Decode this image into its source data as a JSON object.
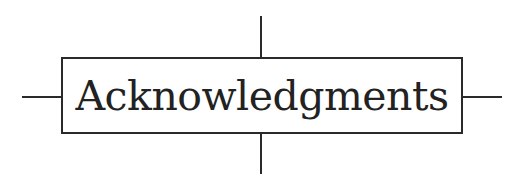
{
  "heading": {
    "title": "Acknowledgments"
  },
  "colors": {
    "ink": "#2a2a2a",
    "background": "#ffffff"
  }
}
